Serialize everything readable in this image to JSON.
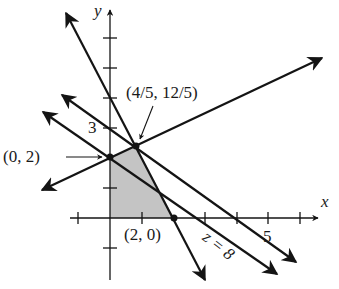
{
  "diagram": {
    "type": "linear-programming-feasible-region",
    "axes": {
      "x_label": "x",
      "y_label": "y",
      "x_tick_label_5": "5",
      "y_tick_label_3": "3",
      "x_ticks": [
        -1,
        1,
        2,
        3,
        4,
        5,
        6
      ],
      "y_ticks": [
        -1,
        1,
        2,
        3,
        4,
        5,
        6
      ]
    },
    "vertices": [
      {
        "label": "(0, 2)",
        "x": 0,
        "y": 2
      },
      {
        "label": "(4/5, 12/5)",
        "x": 0.8,
        "y": 2.4
      },
      {
        "label": "(2, 0)",
        "x": 2,
        "y": 0
      }
    ],
    "objective_line_label": "z = 8",
    "colors": {
      "line": "#141414",
      "shade": "#c4c4c4",
      "background": "#ffffff"
    }
  }
}
